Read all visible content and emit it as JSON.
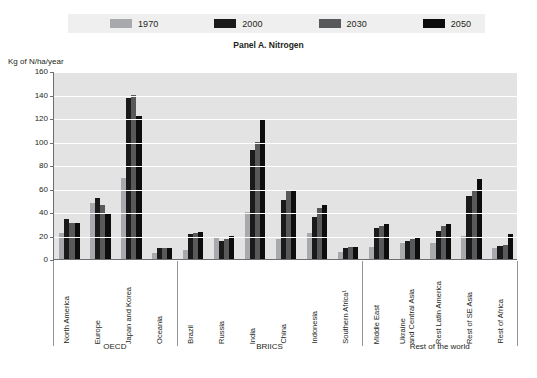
{
  "legend": {
    "items": [
      {
        "label": "1970",
        "color": "#a7a9ac"
      },
      {
        "label": "2000",
        "color": "#1a1a1a"
      },
      {
        "label": "2030",
        "color": "#58595b"
      },
      {
        "label": "2050",
        "color": "#0d0d0d"
      }
    ]
  },
  "panel_title": "Panel A. Nitrogen",
  "y_axis_unit": "Kg of N/ha/year",
  "groups": [
    {
      "label": "OECD",
      "categories": [
        "North America",
        "Europe",
        "Japan and Korea",
        "Oceania"
      ]
    },
    {
      "label": "BRIICS",
      "categories": [
        "Brazil",
        "Russia",
        "India",
        "China",
        "Indonesia",
        "Southern Africa¹"
      ]
    },
    {
      "label": "Rest of the world",
      "categories": [
        "Middle East",
        "Ukraine and Central Asia",
        "Rest Latin America",
        "Rest of SE Asia",
        "Rest of Africa"
      ]
    }
  ],
  "chart_data": {
    "type": "bar",
    "title": "Panel A. Nitrogen",
    "xlabel": "",
    "ylabel": "Kg of N/ha/year",
    "ylim": [
      0,
      160
    ],
    "yticks": [
      0,
      20,
      40,
      60,
      80,
      100,
      120,
      140,
      160
    ],
    "grid": true,
    "legend_position": "top",
    "categories": [
      "North America",
      "Europe",
      "Japan and Korea",
      "Oceania",
      "Brazil",
      "Russia",
      "India",
      "China",
      "Indonesia",
      "Southern Africa¹",
      "Middle East",
      "Ukraine and Central Asia",
      "Rest Latin America",
      "Rest of SE Asia",
      "Rest of Africa"
    ],
    "category_groups": [
      "OECD",
      "OECD",
      "OECD",
      "OECD",
      "BRIICS",
      "BRIICS",
      "BRIICS",
      "BRIICS",
      "BRIICS",
      "BRIICS",
      "Rest of the world",
      "Rest of the world",
      "Rest of the world",
      "Rest of the world",
      "Rest of the world"
    ],
    "series": [
      {
        "name": "1970",
        "color": "#a7a9ac",
        "values": [
          22,
          48,
          69,
          5,
          8,
          18,
          40,
          17,
          22,
          6,
          10,
          14,
          14,
          20,
          9
        ]
      },
      {
        "name": "2000",
        "color": "#1a1a1a",
        "values": [
          34,
          52,
          137,
          9,
          21,
          15,
          93,
          50,
          36,
          9,
          26,
          15,
          24,
          54,
          11
        ]
      },
      {
        "name": "2030",
        "color": "#58595b",
        "values": [
          31,
          46,
          140,
          9,
          22,
          17,
          100,
          58,
          43,
          10,
          28,
          17,
          28,
          58,
          12
        ]
      },
      {
        "name": "2050",
        "color": "#0d0d0d",
        "values": [
          31,
          39,
          122,
          9,
          23,
          20,
          118,
          58,
          46,
          10,
          30,
          19,
          30,
          68,
          21
        ]
      }
    ]
  }
}
